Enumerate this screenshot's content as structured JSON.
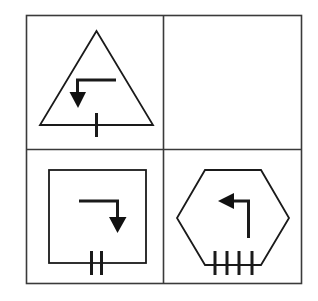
{
  "diagram": {
    "type": "2x2 symbol grid",
    "colors": {
      "background": "#ffffff",
      "line": "#1a1a1a",
      "grid": "#3a3a3a"
    },
    "cells": [
      {
        "position": "top-left",
        "shape": "triangle",
        "arrow": "left-then-down",
        "tick_count": 1
      },
      {
        "position": "top-right",
        "shape": "empty",
        "arrow": "none",
        "tick_count": 0
      },
      {
        "position": "bottom-left",
        "shape": "square",
        "arrow": "right-then-down",
        "tick_count": 2
      },
      {
        "position": "bottom-right",
        "shape": "hexagon",
        "arrow": "up-then-left",
        "tick_count": 4
      }
    ]
  }
}
